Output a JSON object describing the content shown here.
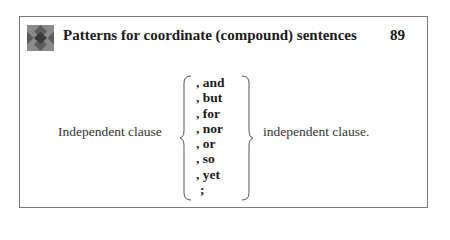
{
  "header": {
    "icon": "diamond-pattern-icon",
    "title": "Patterns for coordinate (compound) sentences",
    "page_number": "89"
  },
  "pattern": {
    "left_clause": "Independent clause",
    "connectors": [
      ", and",
      ", but",
      ", for",
      ", nor",
      ", or",
      ", so",
      ", yet",
      ";"
    ],
    "right_clause": "independent clause."
  }
}
